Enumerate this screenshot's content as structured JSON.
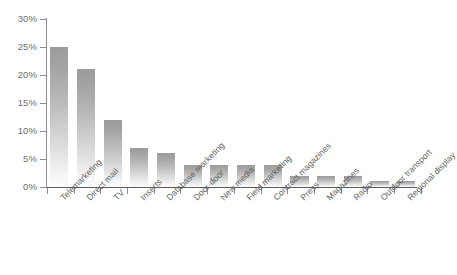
{
  "chart_data": {
    "type": "bar",
    "title": "",
    "subtitle": "",
    "xlabel": "",
    "ylabel": "",
    "categories": [
      "Telemarketing",
      "Direct mail",
      "TV",
      "Inserts",
      "Database marketing",
      "Door-door",
      "New media",
      "Field marketing",
      "Contract magazines",
      "Press",
      "Magazines",
      "Radio",
      "Outdoor transport",
      "Regional display"
    ],
    "values": [
      25,
      21,
      12,
      7,
      6,
      4,
      4,
      4,
      4,
      2,
      2,
      2,
      1,
      1
    ],
    "value_unit": "%",
    "ylim": [
      0,
      30
    ],
    "ytick_values": [
      0,
      5,
      10,
      15,
      20,
      25,
      30
    ],
    "ytick_labels": [
      "0%",
      "5%",
      "10%",
      "15%",
      "20%",
      "25%",
      "30%"
    ],
    "grid": false,
    "legend": null,
    "legend_position": "none",
    "bar_color_top": "#9b9b9b",
    "bar_color_bottom": "#fdfdfd",
    "axis_color": "#5d5d5d",
    "tick_label_color": "#6e6e6e",
    "category_label_color": "#5f5f5f",
    "category_label_rotation": -45,
    "background": "#ffffff"
  }
}
